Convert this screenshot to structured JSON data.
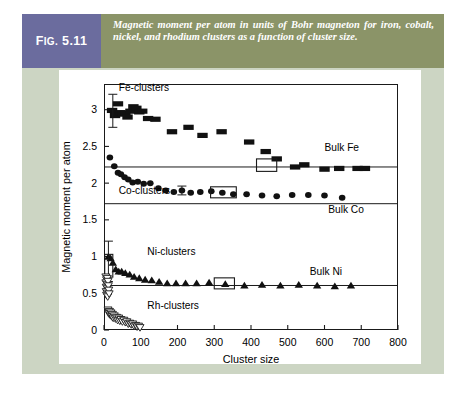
{
  "figure": {
    "tag_prefix": "F",
    "tag_small": "IG.",
    "tag_number": "5.11",
    "caption": "Magnetic moment per atom in units of Bohr magneton for iron, cobalt, nickel, and rhodium clusters as a function of cluster size.",
    "colors": {
      "tag_bg": "#6b6c9e",
      "caption_bg": "#8b9468",
      "panel_bg": "#ccd5c3",
      "plot_bg": "#ffffff",
      "ink": "#1a1a1a"
    }
  },
  "chart_data": {
    "type": "scatter",
    "title": "",
    "xlabel": "Cluster size",
    "ylabel": "Magnetic moment per atom",
    "xlim": [
      0,
      800
    ],
    "ylim": [
      0,
      3.35
    ],
    "xticks": [
      0,
      100,
      200,
      300,
      400,
      500,
      600,
      700,
      800
    ],
    "xticklabels": [
      "0",
      "100",
      "200",
      "300",
      "400",
      "500",
      "600",
      "700",
      "800"
    ],
    "yticks": [
      0,
      0.5,
      1,
      1.5,
      2,
      2.5,
      3
    ],
    "yticklabels": [
      "0",
      "0.5",
      "1",
      "1.5",
      "2",
      "2.5",
      "3"
    ],
    "grid": false,
    "legend_position": "inline-annotations",
    "annotations": [
      {
        "text": "Fe-clusters",
        "x": 40,
        "y": 3.26,
        "name": "fe-clusters-label"
      },
      {
        "text": "Co-clusters",
        "x": 40,
        "y": 1.85,
        "name": "co-clusters-label"
      },
      {
        "text": "Ni-clusters",
        "x": 118,
        "y": 1.02,
        "name": "ni-clusters-label"
      },
      {
        "text": "Rh-clusters",
        "x": 118,
        "y": 0.28,
        "name": "rh-clusters-label"
      },
      {
        "text": "Bulk Fe",
        "x": 600,
        "y": 2.44,
        "name": "bulk-fe-label"
      },
      {
        "text": "Bulk Co",
        "x": 610,
        "y": 1.6,
        "name": "bulk-co-label"
      },
      {
        "text": "Bulk Ni",
        "x": 560,
        "y": 0.75,
        "name": "bulk-ni-label"
      }
    ],
    "reference_lines": [
      {
        "name": "bulk-fe-line",
        "label": "Bulk Fe",
        "y": 2.22,
        "x_start": 0,
        "x_end": 800
      },
      {
        "name": "bulk-co-line",
        "label": "Bulk Co",
        "y": 1.72,
        "x_start": 0,
        "x_end": 800
      },
      {
        "name": "bulk-ni-line",
        "label": "Bulk Ni",
        "y": 0.606,
        "x_start": 0,
        "x_end": 800
      }
    ],
    "series": [
      {
        "name": "Fe-clusters",
        "marker": "square",
        "fill": "#111111",
        "points": [
          {
            "x": 22,
            "y": 2.99
          },
          {
            "x": 30,
            "y": 2.92
          },
          {
            "x": 38,
            "y": 3.08
          },
          {
            "x": 45,
            "y": 2.96
          },
          {
            "x": 52,
            "y": 2.94
          },
          {
            "x": 58,
            "y": 2.95
          },
          {
            "x": 64,
            "y": 2.9
          },
          {
            "x": 72,
            "y": 2.98
          },
          {
            "x": 80,
            "y": 3.04
          },
          {
            "x": 88,
            "y": 3.02
          },
          {
            "x": 96,
            "y": 2.97
          },
          {
            "x": 104,
            "y": 2.98
          },
          {
            "x": 120,
            "y": 2.88
          },
          {
            "x": 140,
            "y": 2.87
          },
          {
            "x": 185,
            "y": 2.7
          },
          {
            "x": 230,
            "y": 2.76
          },
          {
            "x": 268,
            "y": 2.65
          },
          {
            "x": 320,
            "y": 2.7
          },
          {
            "x": 395,
            "y": 2.56
          },
          {
            "x": 440,
            "y": 2.43
          },
          {
            "x": 470,
            "y": 2.33
          },
          {
            "x": 520,
            "y": 2.22
          },
          {
            "x": 545,
            "y": 2.25
          },
          {
            "x": 600,
            "y": 2.19
          },
          {
            "x": 640,
            "y": 2.2
          },
          {
            "x": 690,
            "y": 2.2
          },
          {
            "x": 710,
            "y": 2.2
          }
        ],
        "errorbars": [
          {
            "x": 24,
            "y": 2.99,
            "lo": 2.76,
            "hi": 3.21
          }
        ],
        "highlight_boxes": [
          {
            "x0": 415,
            "x1": 470,
            "y0": 2.16,
            "y1": 2.33
          }
        ]
      },
      {
        "name": "Co-clusters",
        "marker": "circle",
        "fill": "#111111",
        "points": [
          {
            "x": 16,
            "y": 2.35
          },
          {
            "x": 28,
            "y": 2.23
          },
          {
            "x": 38,
            "y": 2.14
          },
          {
            "x": 46,
            "y": 2.12
          },
          {
            "x": 56,
            "y": 2.08
          },
          {
            "x": 66,
            "y": 2.05
          },
          {
            "x": 78,
            "y": 2.01
          },
          {
            "x": 92,
            "y": 2.02
          },
          {
            "x": 108,
            "y": 1.99
          },
          {
            "x": 126,
            "y": 2.0
          },
          {
            "x": 148,
            "y": 1.93
          },
          {
            "x": 168,
            "y": 1.9
          },
          {
            "x": 190,
            "y": 1.88
          },
          {
            "x": 212,
            "y": 1.9
          },
          {
            "x": 236,
            "y": 1.87
          },
          {
            "x": 262,
            "y": 1.88
          },
          {
            "x": 292,
            "y": 1.89
          },
          {
            "x": 322,
            "y": 1.87
          },
          {
            "x": 352,
            "y": 1.85
          },
          {
            "x": 388,
            "y": 1.85
          },
          {
            "x": 430,
            "y": 1.83
          },
          {
            "x": 470,
            "y": 1.82
          },
          {
            "x": 512,
            "y": 1.84
          },
          {
            "x": 556,
            "y": 1.84
          },
          {
            "x": 600,
            "y": 1.83
          },
          {
            "x": 648,
            "y": 1.8
          }
        ],
        "errorbars": [
          {
            "x": 212,
            "y": 1.9,
            "lo": 1.84,
            "hi": 1.96
          }
        ],
        "highlight_boxes": [
          {
            "x0": 290,
            "x1": 360,
            "y0": 1.8,
            "y1": 1.95
          }
        ]
      },
      {
        "name": "Ni-clusters",
        "marker": "triangle-up",
        "fill": "#111111",
        "points": [
          {
            "x": 12,
            "y": 1.0
          },
          {
            "x": 18,
            "y": 0.98
          },
          {
            "x": 24,
            "y": 0.92
          },
          {
            "x": 32,
            "y": 0.83
          },
          {
            "x": 40,
            "y": 0.8
          },
          {
            "x": 48,
            "y": 0.8
          },
          {
            "x": 58,
            "y": 0.78
          },
          {
            "x": 70,
            "y": 0.76
          },
          {
            "x": 82,
            "y": 0.73
          },
          {
            "x": 96,
            "y": 0.71
          },
          {
            "x": 112,
            "y": 0.69
          },
          {
            "x": 130,
            "y": 0.68
          },
          {
            "x": 150,
            "y": 0.66
          },
          {
            "x": 172,
            "y": 0.64
          },
          {
            "x": 196,
            "y": 0.64
          },
          {
            "x": 222,
            "y": 0.64
          },
          {
            "x": 252,
            "y": 0.64
          },
          {
            "x": 286,
            "y": 0.65
          },
          {
            "x": 330,
            "y": 0.63
          },
          {
            "x": 382,
            "y": 0.61
          },
          {
            "x": 430,
            "y": 0.62
          },
          {
            "x": 480,
            "y": 0.61
          },
          {
            "x": 530,
            "y": 0.62
          },
          {
            "x": 580,
            "y": 0.61
          },
          {
            "x": 628,
            "y": 0.6
          },
          {
            "x": 672,
            "y": 0.61
          }
        ],
        "errorbars": [
          {
            "x": 12,
            "y": 1.0,
            "lo": 0.66,
            "hi": 1.21
          }
        ],
        "highlight_boxes": [
          {
            "x0": 2,
            "x1": 24,
            "y0": 0.72,
            "y1": 1.03
          },
          {
            "x0": 300,
            "x1": 355,
            "y0": 0.56,
            "y1": 0.71
          }
        ]
      },
      {
        "name": "Rh-clusters",
        "marker": "triangle-down-open",
        "fill": "#ffffff",
        "points": [
          {
            "x": 11,
            "y": 0.27
          },
          {
            "x": 13,
            "y": 0.22
          },
          {
            "x": 15,
            "y": 0.25
          },
          {
            "x": 17,
            "y": 0.2
          },
          {
            "x": 19,
            "y": 0.23
          },
          {
            "x": 21,
            "y": 0.18
          },
          {
            "x": 23,
            "y": 0.21
          },
          {
            "x": 25,
            "y": 0.16
          },
          {
            "x": 28,
            "y": 0.19
          },
          {
            "x": 31,
            "y": 0.15
          },
          {
            "x": 34,
            "y": 0.17
          },
          {
            "x": 37,
            "y": 0.13
          },
          {
            "x": 40,
            "y": 0.16
          },
          {
            "x": 43,
            "y": 0.12
          },
          {
            "x": 46,
            "y": 0.14
          },
          {
            "x": 50,
            "y": 0.11
          },
          {
            "x": 54,
            "y": 0.13
          },
          {
            "x": 58,
            "y": 0.1
          },
          {
            "x": 62,
            "y": 0.11
          },
          {
            "x": 66,
            "y": 0.08
          },
          {
            "x": 70,
            "y": 0.09
          },
          {
            "x": 74,
            "y": 0.07
          },
          {
            "x": 78,
            "y": 0.08
          },
          {
            "x": 82,
            "y": 0.05
          },
          {
            "x": 86,
            "y": 0.06
          },
          {
            "x": 90,
            "y": 0.04
          },
          {
            "x": 94,
            "y": 0.05
          },
          {
            "x": 98,
            "y": 0.03
          }
        ],
        "errorbars": [],
        "highlight_boxes": []
      },
      {
        "name": "Ni-clusters-lowcluster",
        "marker": "triangle-down-open",
        "fill": "#ffffff",
        "points": [
          {
            "x": 5,
            "y": 0.72
          },
          {
            "x": 7,
            "y": 0.68
          },
          {
            "x": 9,
            "y": 0.7
          },
          {
            "x": 5,
            "y": 0.64
          },
          {
            "x": 8,
            "y": 0.62
          },
          {
            "x": 11,
            "y": 0.66
          },
          {
            "x": 6,
            "y": 0.58
          },
          {
            "x": 9,
            "y": 0.56
          },
          {
            "x": 12,
            "y": 0.6
          },
          {
            "x": 6,
            "y": 0.52
          },
          {
            "x": 9,
            "y": 0.5
          },
          {
            "x": 13,
            "y": 0.54
          },
          {
            "x": 7,
            "y": 0.47
          },
          {
            "x": 10,
            "y": 0.45
          },
          {
            "x": 14,
            "y": 0.49
          }
        ],
        "errorbars": [],
        "highlight_boxes": []
      }
    ]
  }
}
